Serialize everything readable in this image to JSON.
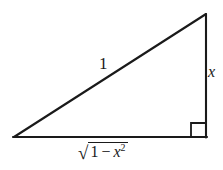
{
  "figure": {
    "stroke_color": "#1a1a1a",
    "background_color": "#ffffff",
    "labels": {
      "hypotenuse": "1",
      "opposite_side": "x",
      "adjacent_radical_sign": "√",
      "adjacent_radicand_one": "1",
      "adjacent_radicand_minus": "−",
      "adjacent_radicand_var": "x",
      "adjacent_radicand_exponent": "2"
    },
    "geometry": {
      "left_vertex_x": 14,
      "left_vertex_y": 137,
      "apex_vertex_x": 206,
      "apex_vertex_y": 14,
      "right_vertex_x": 206,
      "right_vertex_y": 137,
      "right_angle_marker_size": 14,
      "stroke_width": 2
    }
  }
}
